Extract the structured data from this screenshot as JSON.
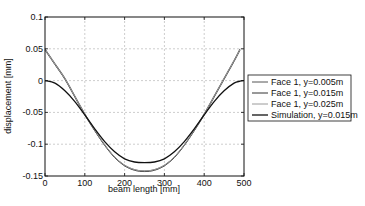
{
  "chart_data": {
    "type": "line",
    "title": "",
    "xlabel": "beam length [mm]",
    "ylabel": "displacement [mm]",
    "xlim": [
      0,
      500
    ],
    "ylim": [
      -0.15,
      0.1
    ],
    "xticks": [
      0,
      100,
      200,
      300,
      400,
      500
    ],
    "xtick_labels": [
      "0",
      "100",
      "200",
      "300",
      "400",
      "500"
    ],
    "yticks": [
      0.1,
      0.05,
      0,
      -0.05,
      -0.1,
      -0.15
    ],
    "ytick_labels": [
      "0.1",
      "0.05",
      "0",
      "-0.05",
      "-0.1",
      "-0.15"
    ],
    "grid": true,
    "legend_position": "outside-right",
    "x": [
      0,
      25,
      50,
      75,
      100,
      125,
      150,
      175,
      200,
      225,
      250,
      275,
      300,
      325,
      350,
      375,
      400,
      425,
      450,
      475,
      490,
      500
    ],
    "series": [
      {
        "name": "Face 1, y=0.005m",
        "color": "#555555",
        "values": [
          0.05,
          0.027,
          0.004,
          -0.024,
          -0.052,
          -0.078,
          -0.101,
          -0.12,
          -0.133,
          -0.14,
          -0.142,
          -0.14,
          -0.133,
          -0.12,
          -0.101,
          -0.078,
          -0.052,
          -0.024,
          0.004,
          0.032,
          0.05,
          null
        ]
      },
      {
        "name": "Face 1, y=0.015m",
        "color": "#333333",
        "values": [
          0.048,
          0.025,
          0.002,
          -0.026,
          -0.054,
          -0.079,
          -0.102,
          -0.121,
          -0.134,
          -0.141,
          -0.143,
          -0.141,
          -0.134,
          -0.121,
          -0.102,
          -0.079,
          -0.054,
          -0.026,
          0.002,
          0.03,
          0.048,
          null
        ]
      },
      {
        "name": "Face 1, y=0.025m",
        "color": "#9a9a9a",
        "values": [
          0.049,
          0.026,
          0.003,
          -0.025,
          -0.053,
          -0.078,
          -0.101,
          -0.12,
          -0.133,
          -0.14,
          -0.142,
          -0.14,
          -0.133,
          -0.12,
          -0.101,
          -0.078,
          -0.053,
          -0.025,
          0.003,
          0.031,
          0.049,
          null
        ]
      },
      {
        "name": "Simulation, y=0.015m",
        "color": "#111111",
        "values": [
          0.0,
          -0.004,
          -0.016,
          -0.033,
          -0.054,
          -0.076,
          -0.096,
          -0.112,
          -0.123,
          -0.128,
          -0.129,
          -0.128,
          -0.123,
          -0.112,
          -0.096,
          -0.076,
          -0.054,
          -0.033,
          -0.016,
          -0.004,
          -0.001,
          0.0
        ]
      }
    ]
  }
}
